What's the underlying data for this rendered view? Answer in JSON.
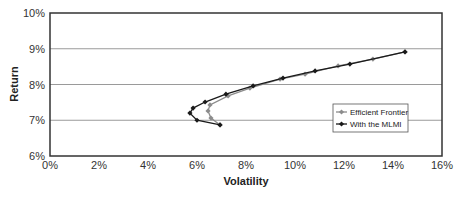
{
  "chart_data": {
    "type": "line",
    "title": "",
    "xlabel": "Volatility",
    "ylabel": "Return",
    "xlim": [
      0,
      16
    ],
    "ylim": [
      6,
      10
    ],
    "x_ticks": [
      "0%",
      "2%",
      "4%",
      "6%",
      "8%",
      "10%",
      "12%",
      "14%",
      "16%"
    ],
    "y_ticks": [
      "6%",
      "7%",
      "8%",
      "9%",
      "10%"
    ],
    "grid": "horizontal",
    "legend_position": "inside-right",
    "series": [
      {
        "name": "Efficient Frontier",
        "color": "#8c8c8c",
        "marker": "diamond",
        "points": [
          [
            6.94,
            6.87
          ],
          [
            6.57,
            7.06
          ],
          [
            6.45,
            7.26
          ],
          [
            6.53,
            7.43
          ],
          [
            7.27,
            7.68
          ],
          [
            8.16,
            7.9
          ],
          [
            9.39,
            8.15
          ],
          [
            10.41,
            8.29
          ],
          [
            11.76,
            8.52
          ],
          [
            13.18,
            8.71
          ],
          [
            14.49,
            8.91
          ]
        ]
      },
      {
        "name": "With the MLMI",
        "color": "#1a1a1a",
        "marker": "diamond",
        "points": [
          [
            6.94,
            6.87
          ],
          [
            6.0,
            7.0
          ],
          [
            5.71,
            7.2
          ],
          [
            5.84,
            7.34
          ],
          [
            6.33,
            7.51
          ],
          [
            7.18,
            7.73
          ],
          [
            8.29,
            7.96
          ],
          [
            9.51,
            8.18
          ],
          [
            10.82,
            8.38
          ],
          [
            12.24,
            8.57
          ],
          [
            14.49,
            8.91
          ]
        ]
      }
    ]
  }
}
